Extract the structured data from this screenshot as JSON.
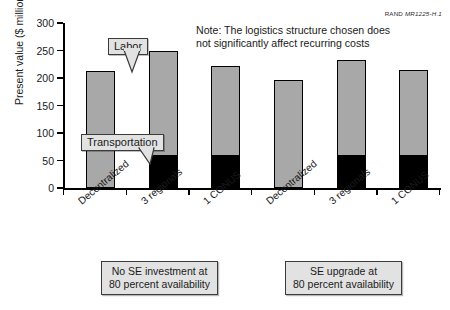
{
  "credit": {
    "prefix": "RAND",
    "code": "MR1225-H.1"
  },
  "note": {
    "line1": "Note:  The logistics structure chosen does",
    "line2": "not significantly affect recurring costs"
  },
  "callouts": {
    "labor": "Labor",
    "transportation": "Transportation"
  },
  "groups": [
    {
      "line1": "No SE investment at",
      "line2": "80 percent availability"
    },
    {
      "line1": "SE upgrade at",
      "line2": "80 percent availability"
    }
  ],
  "chart_data": {
    "type": "bar",
    "stacked": true,
    "title": "",
    "xlabel": "",
    "ylabel": "Present value ($ million)",
    "ylim": [
      0,
      300
    ],
    "yticks": [
      0,
      50,
      100,
      150,
      200,
      250,
      300
    ],
    "ytick_labels": [
      "0",
      "50",
      "100",
      "150",
      "200",
      "250",
      "300"
    ],
    "grid": false,
    "legend": "callout-annotations",
    "categories": [
      "Decentralized",
      "3 regionals",
      "1 CONUS",
      "Decentralized",
      "3 regionals",
      "1 CONUS"
    ],
    "series": [
      {
        "name": "Transportation",
        "color": "#000000",
        "values": [
          0,
          58,
          58,
          0,
          58,
          58
        ]
      },
      {
        "name": "Labor",
        "color": "#a8a8a8",
        "values": [
          213,
          192,
          164,
          196,
          174,
          156
        ]
      }
    ],
    "totals": [
      213,
      250,
      222,
      196,
      232,
      214
    ]
  }
}
